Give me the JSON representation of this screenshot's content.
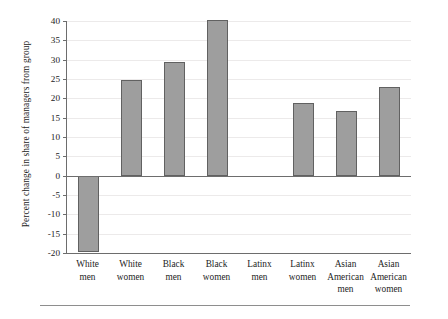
{
  "chart_data": {
    "type": "bar",
    "title": "",
    "xlabel": "",
    "ylabel": "Percent change in share of managers from group",
    "categories": [
      "White men",
      "White women",
      "Black men",
      "Black women",
      "Latinx men",
      "Latinx women",
      "Asian American men",
      "Asian American women"
    ],
    "category_lines": [
      [
        "White",
        "men"
      ],
      [
        "White",
        "women"
      ],
      [
        "Black",
        "men"
      ],
      [
        "Black",
        "women"
      ],
      [
        "Latinx",
        "men"
      ],
      [
        "Latinx",
        "women"
      ],
      [
        "Asian",
        "American",
        "men"
      ],
      [
        "Asian",
        "American",
        "women"
      ]
    ],
    "values": [
      -19.8,
      24.7,
      29.4,
      40.2,
      0,
      18.7,
      16.6,
      22.9
    ],
    "ylim": [
      -20,
      40
    ],
    "ytick_labels": [
      "40",
      "35",
      "30",
      "25",
      "20",
      "15",
      "10",
      "5",
      "0",
      "-5",
      "-10",
      "-15",
      "-20"
    ],
    "ytick_values": [
      40,
      35,
      30,
      25,
      20,
      15,
      10,
      5,
      0,
      -5,
      -10,
      -15,
      -20
    ],
    "grid": true,
    "legend": "none",
    "bar_color": "#9e9e9e",
    "bar_edge_color": "#616161",
    "axis_color": "#6d6d6d",
    "grid_color": "#eceaea",
    "text_color": "#232323"
  }
}
